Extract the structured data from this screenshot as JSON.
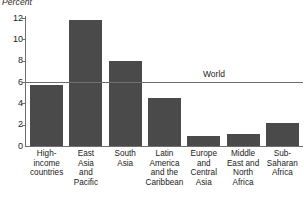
{
  "chart_data": {
    "type": "bar",
    "title": "Percent",
    "xlabel": "",
    "ylabel": "Percent",
    "ylim": [
      0,
      12
    ],
    "yticks": [
      0,
      2,
      4,
      6,
      8,
      10,
      12
    ],
    "grid": false,
    "legend_position": "none",
    "categories": [
      "High-income countries",
      "East Asia and Pacific",
      "South Asia",
      "Latin America and the Caribbean",
      "Europe and Central Asia",
      "Middle East and North Africa",
      "Sub-Saharan Africa"
    ],
    "category_lines": [
      [
        "High-",
        "income",
        "countries"
      ],
      [
        "East",
        "Asia",
        "and",
        "Pacific"
      ],
      [
        "South",
        "Asia"
      ],
      [
        "Latin",
        "America",
        "and the",
        "Caribbean"
      ],
      [
        "Europe",
        "and",
        "Central",
        "Asia"
      ],
      [
        "Middle",
        "East and",
        "North",
        "Africa"
      ],
      [
        "Sub-",
        "Saharan",
        "Africa"
      ]
    ],
    "values": [
      5.7,
      11.8,
      8.0,
      4.5,
      0.9,
      1.1,
      2.2
    ],
    "annotations": [
      {
        "label": "World",
        "type": "reference-line",
        "value": 6.0
      }
    ],
    "colors": {
      "bar": "#4a4a4a",
      "axis": "#6f6f6f",
      "text": "#1a1a1a",
      "background": "#ffffff"
    }
  }
}
